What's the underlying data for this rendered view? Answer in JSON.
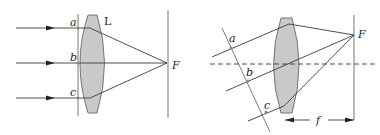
{
  "figure": {
    "left_panel": {
      "description": "Parallel rays along the optical axis converging through lens to focal point",
      "labels": {
        "ray_a": "a",
        "ray_b": "b",
        "ray_c": "c",
        "lens": "L",
        "focus": "F"
      }
    },
    "right_panel": {
      "description": "Oblique parallel rays converging to off-axis point on focal plane",
      "labels": {
        "ray_a": "a",
        "ray_b": "b",
        "ray_c": "c",
        "focus": "F",
        "focal_length": "f"
      }
    },
    "colors": {
      "lens_fill": "#c9c9c9",
      "line": "#3a3a3a"
    }
  }
}
